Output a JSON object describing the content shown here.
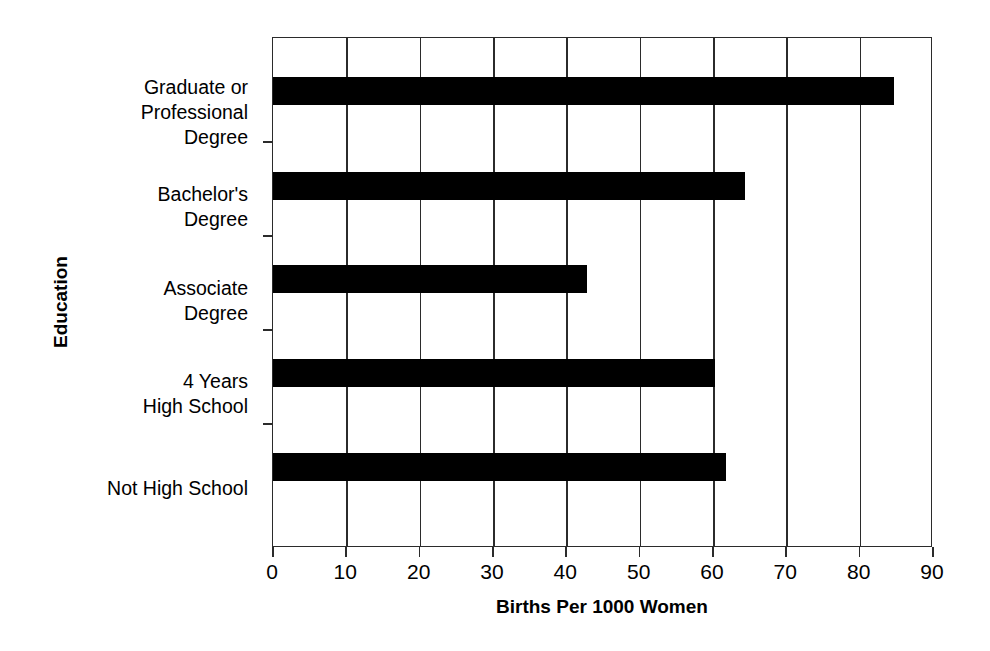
{
  "chart_data": {
    "type": "bar",
    "orientation": "horizontal",
    "title": "",
    "xlabel": "Births Per 1000 Women",
    "ylabel": "Education",
    "categories": [
      "Graduate or Professional Degree",
      "Bachelor's Degree",
      "Associate Degree",
      "4 Years High School",
      "Not High School"
    ],
    "category_lines": [
      [
        "Graduate or",
        "Professional",
        "Degree"
      ],
      [
        "Bachelor's",
        "Degree"
      ],
      [
        "Associate",
        "Degree"
      ],
      [
        "4 Years",
        "High School"
      ],
      [
        "Not High School"
      ]
    ],
    "values": [
      85,
      64.5,
      43,
      60.5,
      62
    ],
    "xlim": [
      0,
      90
    ],
    "xticks": [
      0,
      10,
      20,
      30,
      40,
      50,
      60,
      70,
      80,
      90
    ],
    "xtick_labels": [
      "0",
      "10",
      "20",
      "30",
      "40",
      "50",
      "60",
      "70",
      "80",
      "90"
    ],
    "grid": "vertical",
    "legend": "none",
    "bar_color": "#000000",
    "axis_color": "#2b2b2b",
    "background_color": "#ffffff"
  }
}
